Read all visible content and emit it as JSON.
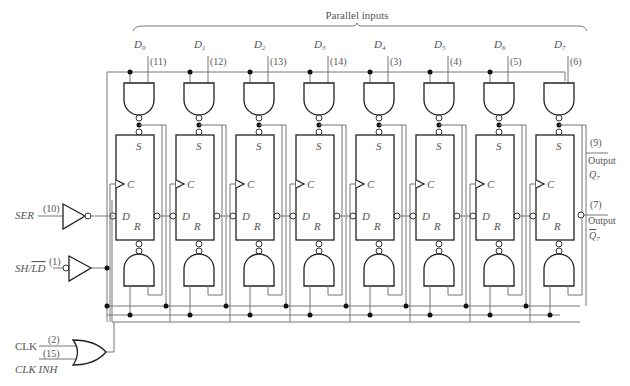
{
  "parallel_inputs_label": "Parallel inputs",
  "stages": [
    {
      "data": "D",
      "sub": "0",
      "pin": "(11)"
    },
    {
      "data": "D",
      "sub": "1",
      "pin": "(12)"
    },
    {
      "data": "D",
      "sub": "2",
      "pin": "(13)"
    },
    {
      "data": "D",
      "sub": "3",
      "pin": "(14)"
    },
    {
      "data": "D",
      "sub": "4",
      "pin": "(3)"
    },
    {
      "data": "D",
      "sub": "5",
      "pin": "(4)"
    },
    {
      "data": "D",
      "sub": "6",
      "pin": "(5)"
    },
    {
      "data": "D",
      "sub": "7",
      "pin": "(6)"
    }
  ],
  "flipflop_pins": {
    "set": "S",
    "clock": "C",
    "data": "D",
    "reset": "R"
  },
  "inputs": {
    "ser": {
      "label": "SER",
      "pin": "(10)"
    },
    "shld": {
      "label_prefix": "SH/",
      "label_bar": "LD",
      "pin": "(1)"
    },
    "clk": {
      "label": "CLK",
      "pin": "(2)"
    },
    "clk_inh": {
      "label": "CLK INH",
      "pin": "(15)"
    }
  },
  "outputs": {
    "q7": {
      "pin": "(9)",
      "label": "Output",
      "signal": "Q",
      "sub": "7"
    },
    "q7bar": {
      "pin": "(7)",
      "label": "Output",
      "signal": "Q",
      "sub": "7",
      "overbar": true
    }
  }
}
